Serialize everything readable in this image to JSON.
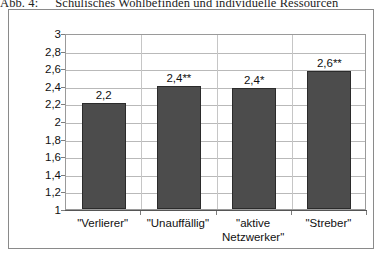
{
  "caption": {
    "label": "Abb. 4:",
    "text": "Schulisches Wohlbefinden und individuelle Ressourcen"
  },
  "chart_data": {
    "type": "bar",
    "title": "",
    "xlabel": "",
    "ylabel": "",
    "categories": [
      "\"Verlierer\"",
      "\"Unauffällig\"",
      "\"aktive Netzwerker\"",
      "\"Streber\""
    ],
    "category_lines": [
      [
        "\"Verlierer\""
      ],
      [
        "\"Unauffällig\""
      ],
      [
        "\"aktive",
        "Netzwerker\""
      ],
      [
        "\"Streber\""
      ]
    ],
    "values": [
      2.2,
      2.4,
      2.37,
      2.57
    ],
    "data_labels": [
      "2,2",
      "2,4**",
      "2,4*",
      "2,6**"
    ],
    "ylim": [
      1,
      3
    ],
    "ytick_labels": [
      "3",
      "2,8",
      "2,6",
      "2,4",
      "2,2",
      "2",
      "1,8",
      "1,6",
      "1,4",
      "1,2",
      "1"
    ],
    "ytick_values": [
      3,
      2.8,
      2.6,
      2.4,
      2.2,
      2,
      1.8,
      1.6,
      1.4,
      1.2,
      1
    ],
    "grid": "horizontal-and-category-separators",
    "legend": "none",
    "bar_color": "#4c4c4c",
    "bar_border_color": "#2b2b2b",
    "gridline_color": "#b9b9b9",
    "axis_color": "#555555",
    "background": "#ffffff"
  }
}
